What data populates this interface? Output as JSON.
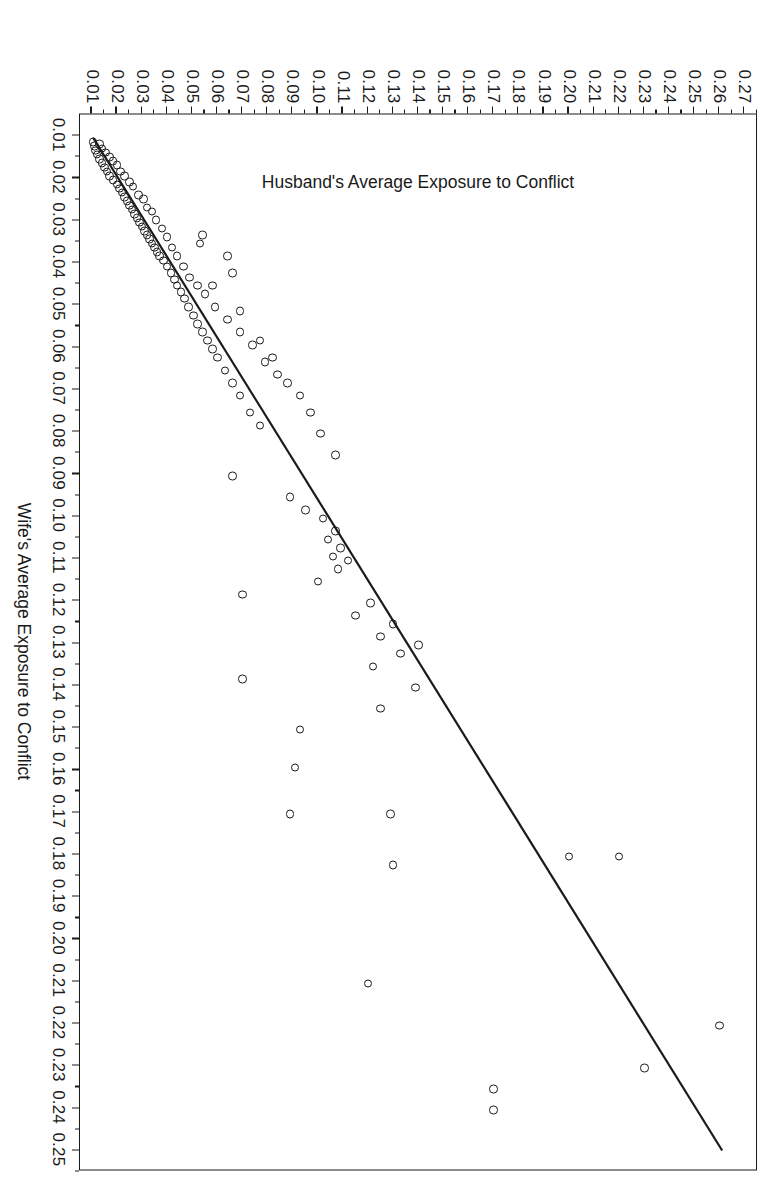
{
  "chart": {
    "type": "scatter",
    "title": "",
    "background_color": "#ffffff",
    "marker_color": "#1a1a1a",
    "line_color": "#1a1a1a",
    "orientation_note": "image is the chart rotated 90 degrees clockwise"
  },
  "axes": {
    "x": {
      "label": "Wife's Average Exposure to Conflict",
      "min": 0.005,
      "max": 0.255,
      "tick_labels": [
        "0.01",
        "0.02",
        "0.03",
        "0.04",
        "0.05",
        "0.06",
        "0.07",
        "0.08",
        "0.09",
        "0.10",
        "0.11",
        "0.12",
        "0.13",
        "0.14",
        "0.15",
        "0.16",
        "0.17",
        "0.18",
        "0.19",
        "0.20",
        "0.21",
        "0.22",
        "0.23",
        "0.24",
        "0.25"
      ],
      "tick_values": [
        0.01,
        0.02,
        0.03,
        0.04,
        0.05,
        0.06,
        0.07,
        0.08,
        0.09,
        0.1,
        0.11,
        0.12,
        0.13,
        0.14,
        0.15,
        0.16,
        0.17,
        0.18,
        0.19,
        0.2,
        0.21,
        0.22,
        0.23,
        0.24,
        0.25
      ]
    },
    "y": {
      "label": "Husband's Average Exposure to Conflict",
      "min": 0.005,
      "max": 0.275,
      "tick_labels": [
        "0.01",
        "0.02",
        "0.03",
        "0.04",
        "0.05",
        "0.06",
        "0.07",
        "0.08",
        "0.09",
        "0.10",
        "0.11",
        "0.12",
        "0.13",
        "0.14",
        "0.15",
        "0.16",
        "0.17",
        "0.18",
        "0.19",
        "0.20",
        "0.21",
        "0.22",
        "0.23",
        "0.24",
        "0.25",
        "0.26",
        "0.27"
      ],
      "tick_values": [
        0.01,
        0.02,
        0.03,
        0.04,
        0.05,
        0.06,
        0.07,
        0.08,
        0.09,
        0.1,
        0.11,
        0.12,
        0.13,
        0.14,
        0.15,
        0.16,
        0.17,
        0.18,
        0.19,
        0.2,
        0.21,
        0.22,
        0.23,
        0.24,
        0.25,
        0.26,
        0.27
      ]
    }
  },
  "chart_data": {
    "type": "scatter",
    "title": "",
    "xlabel": "Wife's Average Exposure to Conflict",
    "ylabel": "Husband's Average Exposure to Conflict",
    "xlim": [
      0.005,
      0.255
    ],
    "ylim": [
      0.005,
      0.275
    ],
    "grid": false,
    "legend": null,
    "marker": "open-circle",
    "fit_line": {
      "type": "linear",
      "x_start": 0.0105,
      "y_start": 0.0105,
      "x_end": 0.2505,
      "y_end": 0.2615,
      "slope": 1.046,
      "intercept": -0.0005
    },
    "points": [
      [
        0.0115,
        0.011
      ],
      [
        0.0125,
        0.0115
      ],
      [
        0.012,
        0.0135
      ],
      [
        0.0135,
        0.012
      ],
      [
        0.0145,
        0.0125
      ],
      [
        0.013,
        0.0145
      ],
      [
        0.0155,
        0.0135
      ],
      [
        0.014,
        0.016
      ],
      [
        0.0165,
        0.0145
      ],
      [
        0.015,
        0.0175
      ],
      [
        0.0175,
        0.0155
      ],
      [
        0.016,
        0.019
      ],
      [
        0.0185,
        0.0165
      ],
      [
        0.017,
        0.0205
      ],
      [
        0.0195,
        0.0175
      ],
      [
        0.0185,
        0.022
      ],
      [
        0.0205,
        0.019
      ],
      [
        0.0195,
        0.0235
      ],
      [
        0.0215,
        0.0205
      ],
      [
        0.021,
        0.0255
      ],
      [
        0.0225,
        0.0215
      ],
      [
        0.022,
        0.027
      ],
      [
        0.0235,
        0.0225
      ],
      [
        0.0245,
        0.0235
      ],
      [
        0.024,
        0.029
      ],
      [
        0.0255,
        0.0245
      ],
      [
        0.025,
        0.031
      ],
      [
        0.0265,
        0.0255
      ],
      [
        0.0275,
        0.0265
      ],
      [
        0.027,
        0.0325
      ],
      [
        0.0285,
        0.0275
      ],
      [
        0.028,
        0.0345
      ],
      [
        0.0295,
        0.0285
      ],
      [
        0.0305,
        0.0295
      ],
      [
        0.03,
        0.036
      ],
      [
        0.0315,
        0.0305
      ],
      [
        0.0325,
        0.0315
      ],
      [
        0.0335,
        0.0325
      ],
      [
        0.032,
        0.0385
      ],
      [
        0.0345,
        0.0335
      ],
      [
        0.0355,
        0.0345
      ],
      [
        0.034,
        0.0405
      ],
      [
        0.0365,
        0.0355
      ],
      [
        0.0375,
        0.0365
      ],
      [
        0.0385,
        0.0375
      ],
      [
        0.0365,
        0.0425
      ],
      [
        0.0395,
        0.039
      ],
      [
        0.041,
        0.0405
      ],
      [
        0.0385,
        0.0445
      ],
      [
        0.0425,
        0.042
      ],
      [
        0.044,
        0.0435
      ],
      [
        0.041,
        0.047
      ],
      [
        0.0455,
        0.0445
      ],
      [
        0.047,
        0.046
      ],
      [
        0.0435,
        0.0495
      ],
      [
        0.0485,
        0.0475
      ],
      [
        0.0505,
        0.049
      ],
      [
        0.0455,
        0.0525
      ],
      [
        0.0525,
        0.051
      ],
      [
        0.0545,
        0.0525
      ],
      [
        0.0475,
        0.0555
      ],
      [
        0.0565,
        0.0545
      ],
      [
        0.0585,
        0.0565
      ],
      [
        0.0505,
        0.0595
      ],
      [
        0.0605,
        0.0585
      ],
      [
        0.0625,
        0.0605
      ],
      [
        0.0535,
        0.0645
      ],
      [
        0.0655,
        0.0635
      ],
      [
        0.0565,
        0.0695
      ],
      [
        0.0685,
        0.0665
      ],
      [
        0.0595,
        0.0745
      ],
      [
        0.0715,
        0.0695
      ],
      [
        0.0635,
        0.0795
      ],
      [
        0.0755,
        0.0735
      ],
      [
        0.0665,
        0.0845
      ],
      [
        0.0785,
        0.0775
      ],
      [
        0.0385,
        0.0645
      ],
      [
        0.0425,
        0.0665
      ],
      [
        0.0455,
        0.0585
      ],
      [
        0.0355,
        0.0535
      ],
      [
        0.0335,
        0.0545
      ],
      [
        0.0515,
        0.0695
      ],
      [
        0.0585,
        0.0775
      ],
      [
        0.0625,
        0.0825
      ],
      [
        0.0685,
        0.0885
      ],
      [
        0.0715,
        0.0935
      ],
      [
        0.0755,
        0.0975
      ],
      [
        0.0805,
        0.1015
      ],
      [
        0.0855,
        0.1075
      ],
      [
        0.0905,
        0.0665
      ],
      [
        0.0955,
        0.0895
      ],
      [
        0.0985,
        0.0955
      ],
      [
        0.1005,
        0.1025
      ],
      [
        0.1035,
        0.1075
      ],
      [
        0.1055,
        0.1045
      ],
      [
        0.1075,
        0.1095
      ],
      [
        0.1095,
        0.1065
      ],
      [
        0.1105,
        0.1125
      ],
      [
        0.1125,
        0.1085
      ],
      [
        0.1155,
        0.1005
      ],
      [
        0.1185,
        0.0705
      ],
      [
        0.1205,
        0.1215
      ],
      [
        0.1235,
        0.1155
      ],
      [
        0.1255,
        0.1305
      ],
      [
        0.1285,
        0.1255
      ],
      [
        0.1305,
        0.1405
      ],
      [
        0.1325,
        0.1335
      ],
      [
        0.1355,
        0.1225
      ],
      [
        0.1385,
        0.0705
      ],
      [
        0.1405,
        0.1395
      ],
      [
        0.1455,
        0.1255
      ],
      [
        0.1505,
        0.0935
      ],
      [
        0.1595,
        0.0915
      ],
      [
        0.1705,
        0.1295
      ],
      [
        0.1705,
        0.0895
      ],
      [
        0.1805,
        0.2005
      ],
      [
        0.1805,
        0.2205
      ],
      [
        0.1825,
        0.1305
      ],
      [
        0.2105,
        0.1205
      ],
      [
        0.2205,
        0.2605
      ],
      [
        0.2305,
        0.2305
      ],
      [
        0.2355,
        0.1705
      ],
      [
        0.2405,
        0.1705
      ],
      [
        0.2605,
        0.2205
      ]
    ]
  }
}
